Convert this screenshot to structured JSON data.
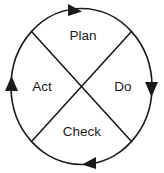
{
  "diagram": {
    "type": "pdca-cycle",
    "direction": "clockwise",
    "colors": {
      "stroke": "#1a1a1a",
      "text": "#1a1a1a",
      "background": "#ffffff"
    },
    "quadrants": [
      {
        "id": "plan",
        "label": "Plan",
        "position": "top"
      },
      {
        "id": "do",
        "label": "Do",
        "position": "right"
      },
      {
        "id": "check",
        "label": "Check",
        "position": "bottom"
      },
      {
        "id": "act",
        "label": "Act",
        "position": "left"
      }
    ],
    "arrows": [
      {
        "id": "arrow-top",
        "position": "top",
        "points": "right"
      },
      {
        "id": "arrow-right",
        "position": "right",
        "points": "down"
      },
      {
        "id": "arrow-bottom",
        "position": "bottom",
        "points": "left"
      },
      {
        "id": "arrow-left",
        "position": "left",
        "points": "up"
      }
    ]
  }
}
